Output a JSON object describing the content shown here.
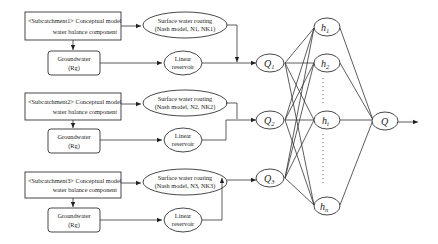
{
  "diagram": {
    "subcatchments": [
      {
        "model_line1": "<Subcatchment1> Conceptual model",
        "model_line2": "water balance component",
        "routing_line1": "Surface water routing",
        "routing_line2": "(Nash model, N1, NK1)",
        "groundwater_line1": "Groundwater",
        "groundwater_line2": "(Rg)",
        "reservoir_line1": "Linear",
        "reservoir_line2": "reservoir",
        "output_node": "Q",
        "output_sub": "1"
      },
      {
        "model_line1": "<Subcatchment2> Conceptual model",
        "model_line2": "water balance component",
        "routing_line1": "Surface water routing",
        "routing_line2": "(Nash model, N2, NK2)",
        "groundwater_line1": "Groundwater",
        "groundwater_line2": "(Rg)",
        "reservoir_line1": "Linear",
        "reservoir_line2": "reservoir",
        "output_node": "Q",
        "output_sub": "2"
      },
      {
        "model_line1": "<Subcatchment3> Conceptual model",
        "model_line2": "water balance component",
        "routing_line1": "Surface water routing",
        "routing_line2": "(Nash model, N3, NK3)",
        "groundwater_line1": "Groundwater",
        "groundwater_line2": "(Rg)",
        "reservoir_line1": "Linear",
        "reservoir_line2": "reservoir",
        "output_node": "Q",
        "output_sub": "3"
      }
    ],
    "hidden_nodes": [
      {
        "label": "h",
        "sub": "1"
      },
      {
        "label": "h",
        "sub": "2"
      },
      {
        "label": "h",
        "sub": "i"
      },
      {
        "label": "h",
        "sub": "n"
      }
    ],
    "output_node": {
      "label": "Q"
    }
  }
}
